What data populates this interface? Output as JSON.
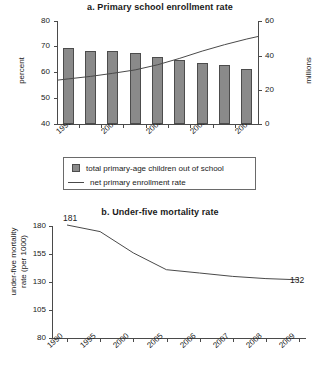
{
  "chart_data": [
    {
      "type": "bar",
      "id": "panel-a",
      "title": "a. Primary school enrollment rate",
      "xlabel": "",
      "ylabel": "percent",
      "y2label": "millions",
      "grid": false,
      "legend_position": "bottom",
      "categories": [
        "1999",
        "2000",
        "2001",
        "2002",
        "2003",
        "2004",
        "2005",
        "2006",
        "2007"
      ],
      "xtick_labels": [
        "1999",
        "2001",
        "2003",
        "2005",
        "2007"
      ],
      "xtick_label_indices": [
        0,
        2,
        4,
        6,
        8
      ],
      "ylim": [
        40,
        80
      ],
      "yticks": [
        40,
        50,
        60,
        70,
        80
      ],
      "y2lim": [
        0,
        60
      ],
      "y2ticks": [
        0,
        20,
        40,
        60
      ],
      "series": [
        {
          "name": "total primary-age children out of school",
          "kind": "bar",
          "axis": "right",
          "unit": "millions",
          "values": [
            44.0,
            42.8,
            42.5,
            41.3,
            39.3,
            37.3,
            35.5,
            34.2,
            32.2
          ]
        },
        {
          "name": "net primary enrollment rate",
          "kind": "line",
          "axis": "left",
          "unit": "percent",
          "values": [
            57.5,
            58.5,
            59.7,
            61.0,
            63.0,
            65.5,
            68.3,
            70.8,
            73.0
          ]
        }
      ],
      "legend": [
        "total primary-age children out of school",
        "net primary enrollment rate"
      ]
    },
    {
      "type": "line",
      "id": "panel-b",
      "title": "b. Under-five mortality rate",
      "xlabel": "",
      "ylabel": "under-five mortality rate (per 1000)",
      "ylabel_line1": "under-five mortality",
      "ylabel_line2": "rate (per 1000)",
      "grid": false,
      "x": [
        "1990",
        "1995",
        "2000",
        "2005",
        "2006",
        "2007",
        "2008",
        "2009"
      ],
      "ylim": [
        80,
        180
      ],
      "yticks": [
        80,
        105,
        130,
        155,
        180
      ],
      "values": [
        181,
        175,
        156,
        141,
        138,
        135,
        133,
        132
      ],
      "annotations": [
        {
          "text": "181",
          "x": "1990",
          "y": 181,
          "position": "above-right"
        },
        {
          "text": "132",
          "x": "2009",
          "y": 132,
          "position": "right"
        }
      ]
    }
  ],
  "colors": {
    "bar_fill": "#8a8a8a",
    "bar_stroke": "#4c4c4c",
    "line": "#4a4a4a",
    "axis": "#4a4a4a",
    "text": "#1a1a1a",
    "background": "#ffffff"
  }
}
